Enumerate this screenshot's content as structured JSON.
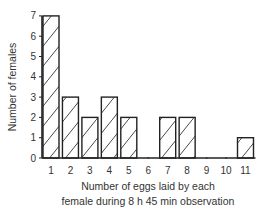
{
  "chart_data": {
    "type": "bar",
    "title": "",
    "xlabel": "Number of eggs laid by each female during 8 h 45 min observation",
    "xlabel_lines": [
      "Number of eggs laid by each",
      "female during 8 h 45 min observation"
    ],
    "ylabel": "Number of females",
    "categories": [
      "1",
      "2",
      "3",
      "4",
      "5",
      "6",
      "7",
      "8",
      "9",
      "10",
      "11"
    ],
    "values": [
      7,
      3,
      2,
      3,
      2,
      0,
      2,
      2,
      0,
      0,
      1
    ],
    "ylim": [
      0,
      7
    ],
    "yticks": [
      0,
      1,
      2,
      3,
      4,
      5,
      6,
      7
    ],
    "grid": false,
    "legend": null,
    "bar_style": "hatched",
    "colors": {
      "bar_fill": "#ffffff",
      "bar_stroke": "#222222",
      "hatch": "#333333",
      "axis": "#222222"
    }
  }
}
